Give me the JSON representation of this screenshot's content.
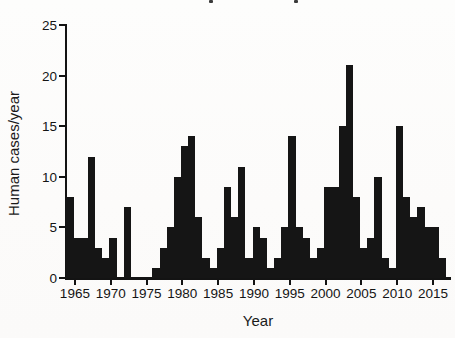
{
  "figure": {
    "xlabel": "Year",
    "ylabel": "Human cases/year",
    "title_cropped": true
  },
  "chart_data": {
    "type": "bar",
    "title": "",
    "xlabel": "Year",
    "ylabel": "Human cases/year",
    "bar_color": "#151515",
    "grid": false,
    "legend": false,
    "ylim": [
      0,
      25
    ],
    "yticks": [
      0,
      5,
      10,
      15,
      20,
      25
    ],
    "xticks": [
      1965,
      1970,
      1975,
      1980,
      1985,
      1990,
      1995,
      2000,
      2005,
      2010,
      2015
    ],
    "categories": [
      1964,
      1965,
      1966,
      1967,
      1968,
      1969,
      1970,
      1971,
      1972,
      1973,
      1974,
      1975,
      1976,
      1977,
      1978,
      1979,
      1980,
      1981,
      1982,
      1983,
      1984,
      1985,
      1986,
      1987,
      1988,
      1989,
      1990,
      1991,
      1992,
      1993,
      1994,
      1995,
      1996,
      1997,
      1998,
      1999,
      2000,
      2001,
      2002,
      2003,
      2004,
      2005,
      2006,
      2007,
      2008,
      2009,
      2010,
      2011,
      2012,
      2013,
      2014,
      2015,
      2016
    ],
    "values": [
      8,
      4,
      4,
      12,
      3,
      2,
      4,
      0,
      7,
      0,
      0,
      0,
      1,
      3,
      5,
      10,
      13,
      14,
      6,
      2,
      1,
      3,
      9,
      6,
      11,
      2,
      5,
      4,
      1,
      2,
      5,
      14,
      5,
      4,
      2,
      3,
      9,
      9,
      15,
      21,
      8,
      3,
      4,
      10,
      2,
      1,
      15,
      8,
      6,
      7,
      5,
      5,
      2
    ],
    "title_fragments_x": [
      209,
      294
    ]
  },
  "layout_note": "cropped figure: only chart area with x/y axes visible"
}
